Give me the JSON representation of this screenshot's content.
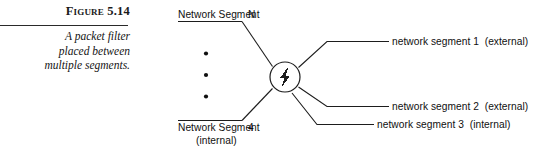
{
  "figure": {
    "label_word": "Figure",
    "label_number": "5.14",
    "caption_lines": [
      "A packet filter",
      "placed between",
      "multiple segments."
    ]
  },
  "diagram": {
    "center_node": {
      "icon": "lightning-bolt-icon",
      "shape": "circle"
    },
    "vertical_ellipsis": {
      "dot_count": 3,
      "symbol": "•"
    },
    "left_segments": [
      {
        "name": "Network Segment",
        "index": "N",
        "qualifier": ""
      },
      {
        "name": "Network Segment",
        "index": "4",
        "qualifier": "(internal)"
      }
    ],
    "right_segments": [
      {
        "label": "network segment 1",
        "qualifier": "(external)"
      },
      {
        "label": "network segment 2",
        "qualifier": "(external)"
      },
      {
        "label": "network segment 3",
        "qualifier": "(internal)"
      }
    ]
  },
  "colors": {
    "ink": "#1d1d1d",
    "background": "#ffffff"
  }
}
